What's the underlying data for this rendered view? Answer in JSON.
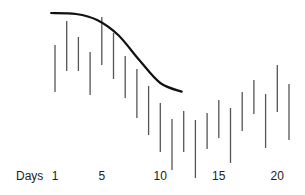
{
  "chart_data": {
    "type": "bar",
    "subtype": "high-low range bars with overlaid curve",
    "title": "",
    "xlabel": "Days",
    "ylabel": "",
    "x_tick_labels": [
      "1",
      "5",
      "10",
      "15",
      "20"
    ],
    "x_tick_values": [
      1,
      5,
      10,
      15,
      20
    ],
    "grid": false,
    "legend": null,
    "series": [
      {
        "name": "range",
        "points": [
          {
            "x": 1,
            "high": 45,
            "low": 92
          },
          {
            "x": 2,
            "high": 21,
            "low": 71
          },
          {
            "x": 3,
            "high": 37,
            "low": 71
          },
          {
            "x": 4,
            "high": 52,
            "low": 95
          },
          {
            "x": 5,
            "high": 17,
            "low": 65
          },
          {
            "x": 6,
            "high": 33,
            "low": 79
          },
          {
            "x": 7,
            "high": 56,
            "low": 98
          },
          {
            "x": 8,
            "high": 69,
            "low": 118
          },
          {
            "x": 9,
            "high": 86,
            "low": 135
          },
          {
            "x": 10,
            "high": 103,
            "low": 152
          },
          {
            "x": 11,
            "high": 119,
            "low": 170
          },
          {
            "x": 12,
            "high": 111,
            "low": 152
          },
          {
            "x": 13,
            "high": 120,
            "low": 178
          },
          {
            "x": 14,
            "high": 113,
            "low": 149
          },
          {
            "x": 15,
            "high": 100,
            "low": 138
          },
          {
            "x": 16,
            "high": 108,
            "low": 163
          },
          {
            "x": 17,
            "high": 92,
            "low": 131
          },
          {
            "x": 18,
            "high": 80,
            "low": 114
          },
          {
            "x": 19,
            "high": 94,
            "low": 148
          },
          {
            "x": 20,
            "high": 65,
            "low": 112
          },
          {
            "x": 21,
            "high": 84,
            "low": 140
          }
        ],
        "value_note": "values are relative levels on an unlabeled inverted scale (smaller = higher)"
      },
      {
        "name": "trend curve",
        "type": "line",
        "points": [
          {
            "x": 0.6,
            "y": 13
          },
          {
            "x": 2.8,
            "y": 14
          },
          {
            "x": 4.6,
            "y": 20
          },
          {
            "x": 6.4,
            "y": 35
          },
          {
            "x": 8.2,
            "y": 60
          },
          {
            "x": 10.0,
            "y": 83
          },
          {
            "x": 11.9,
            "y": 92
          }
        ]
      }
    ]
  }
}
